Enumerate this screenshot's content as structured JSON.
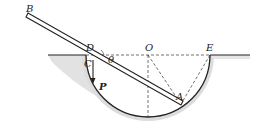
{
  "diagram": {
    "labels": {
      "B": "B",
      "D": "D",
      "O": "O",
      "E": "E",
      "C": "C",
      "theta": "θ",
      "P": "P",
      "A": "A"
    },
    "colors": {
      "line": "#222222",
      "ground_shade": "#d8d8d8",
      "background": "#ffffff"
    }
  }
}
